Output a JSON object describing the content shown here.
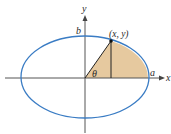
{
  "diagram": {
    "type": "ellipse-parametric",
    "labels": {
      "x_axis": "x",
      "y_axis": "y",
      "semi_major": "a",
      "semi_minor": "b",
      "point": "(x, y)",
      "angle": "θ"
    },
    "colors": {
      "ellipse": "#3a7cc4",
      "fill": "#e2c08e",
      "axes": "#555555",
      "lines": "#222222",
      "text": "#2a2a2a"
    }
  }
}
